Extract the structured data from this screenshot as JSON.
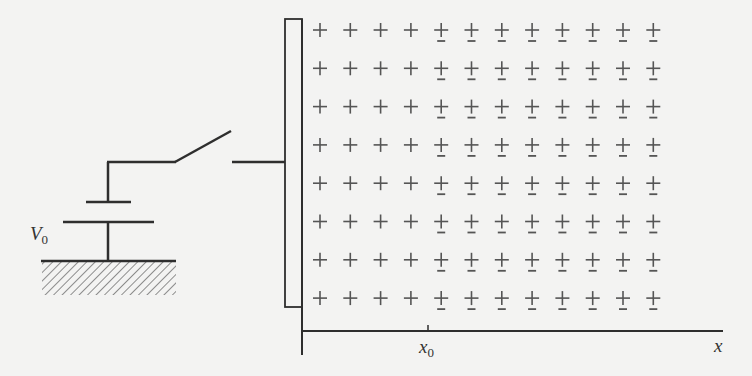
{
  "diagram": {
    "type": "circuit-charge-distribution",
    "labels": {
      "voltage": "V",
      "voltage_sub": "0",
      "x0": "x",
      "x0_sub": "0",
      "x_axis": "x"
    },
    "battery": {
      "label": "V0",
      "grounded": true
    },
    "switch": {
      "state": "open"
    },
    "plate": {
      "shape": "vertical rectangle electrode"
    },
    "charge_grid": {
      "rows": 8,
      "columns": 12,
      "positive_symbol": "+",
      "negative_symbol": "−",
      "negative_start_column": 5,
      "note": "all cells show +; columns at and beyond x0 (columns 5–12) also show − beneath"
    },
    "colors": {
      "background": "#f3f3f2",
      "ink": "#2e2e2e",
      "signs": "#555555"
    }
  }
}
